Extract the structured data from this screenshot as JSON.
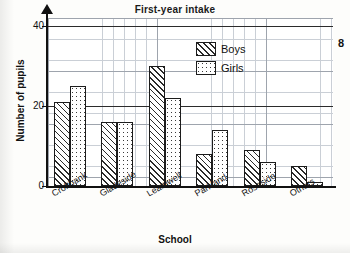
{
  "margin_note": "8",
  "chart_data": {
    "type": "bar",
    "title": "First-year intake",
    "xlabel": "School",
    "ylabel": "Number of pupils",
    "categories": [
      "Croftbank",
      "Gladeside",
      "Learnwell",
      "Parkland",
      "Roseside",
      "Others"
    ],
    "series": [
      {
        "name": "Boys",
        "values": [
          21,
          16,
          30,
          8,
          9,
          5
        ]
      },
      {
        "name": "Girls",
        "values": [
          25,
          16,
          22,
          14,
          6,
          1
        ]
      }
    ],
    "ylim": [
      0,
      42
    ],
    "y_ticks": [
      0,
      20,
      40
    ],
    "y_tick_labels": [
      "0",
      "20",
      "40"
    ],
    "grid": true,
    "grid_style": "graph-paper",
    "legend_position": "inside-top-right",
    "legend_entries": [
      "Boys",
      "Girls"
    ],
    "patterns": {
      "Boys": "diagonal-hatch",
      "Girls": "dotted-stipple"
    },
    "colors": {
      "ink": "#1c1c1c",
      "grid_minor": "#b9bfc9",
      "grid_major": "#7b828d",
      "background": "#ffffff"
    }
  }
}
